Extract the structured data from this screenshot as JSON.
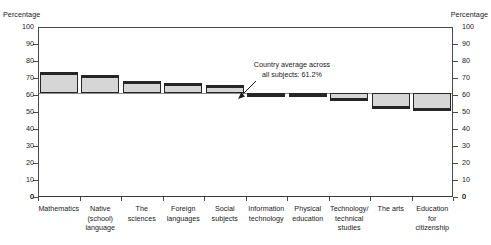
{
  "axis": {
    "left_caption": "Percentage",
    "right_caption": "Percentage",
    "ticks": [
      "100",
      "90",
      "80",
      "70",
      "60",
      "50",
      "40",
      "30",
      "20",
      "10",
      "0"
    ]
  },
  "annotation": {
    "line1": "Country average across",
    "line2": "all subjects: 61.2%",
    "arrow_icon": "arrow-down-left-icon"
  },
  "chart_data": {
    "type": "bar",
    "title": "",
    "subtitle": "",
    "xlabel": "",
    "ylabel": "Percentage",
    "ylim": [
      0,
      100
    ],
    "ytick_step": 10,
    "grid": false,
    "legend": "none",
    "baseline_value": 61.2,
    "baseline_label": "Country average across all subjects: 61.2%",
    "note": "Deviation bars anchored at the 61.2% country average line; bars above the line exceed the average, bars below fall short.",
    "categories": [
      "Mathematics",
      "Native (school) language",
      "The sciences",
      "Foreign languages",
      "Social subjects",
      "Information technology",
      "Physical education",
      "Technology/ technical studies",
      "The arts",
      "Education for citizenship"
    ],
    "category_labels_multiline": [
      [
        "Mathematics"
      ],
      [
        "Native",
        "(school)",
        "language"
      ],
      [
        "The",
        "sciences"
      ],
      [
        "Foreign",
        "languages"
      ],
      [
        "Social",
        "subjects"
      ],
      [
        "Information",
        "technology"
      ],
      [
        "Physical",
        "education"
      ],
      [
        "Technology/",
        "technical",
        "studies"
      ],
      [
        "The arts"
      ],
      [
        "Education",
        "for",
        "citizenship"
      ]
    ],
    "values": [
      73.5,
      71.5,
      68.5,
      67.0,
      66.0,
      59.5,
      59.0,
      56.5,
      51.5,
      50.5
    ],
    "series": [
      {
        "name": "Percentage",
        "values": [
          73.5,
          71.5,
          68.5,
          67.0,
          66.0,
          59.5,
          59.0,
          56.5,
          51.5,
          50.5
        ]
      }
    ],
    "deviation_from_average": [
      12.3,
      10.3,
      7.3,
      5.8,
      4.8,
      -1.7,
      -2.2,
      -4.7,
      -9.7,
      -10.7
    ],
    "colors": {
      "bar_fill": "#d6d6d6",
      "bar_border": "#262626",
      "average_line": "#8d8d8d",
      "axis": "#4a4a4a",
      "text": "#1a1a1a"
    }
  }
}
